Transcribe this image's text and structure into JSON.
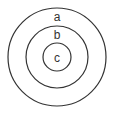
{
  "diagram": {
    "type": "concentric-circles",
    "rings": [
      {
        "id": "outer",
        "label": "a"
      },
      {
        "id": "middle",
        "label": "b"
      },
      {
        "id": "inner",
        "label": "c"
      }
    ],
    "stroke_color": "#333333",
    "background": "#ffffff"
  }
}
